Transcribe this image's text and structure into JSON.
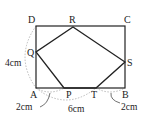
{
  "diagram": {
    "type": "geometry-figure",
    "shape": "rectangle ABCD with inscribed pentagon P-Q-R-S-T",
    "colors": {
      "line": "#222222",
      "dashed": "#aaaaaa",
      "text": "#222222"
    },
    "vertices": {
      "A": "A",
      "B": "B",
      "C": "C",
      "D": "D",
      "P": "P",
      "Q": "Q",
      "R": "R",
      "S": "S",
      "T": "T"
    },
    "measurements": {
      "AD": "4cm",
      "AP": "2cm",
      "PB_span": "6cm",
      "TB": "2cm"
    }
  }
}
